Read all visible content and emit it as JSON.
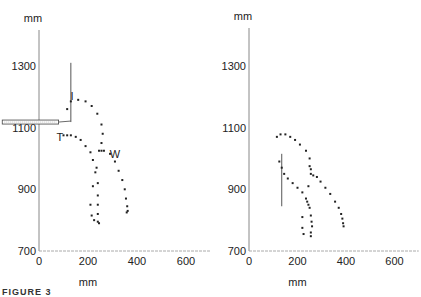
{
  "caption": "FIGURE 3",
  "chart_data": [
    {
      "type": "scatter",
      "panel": "left",
      "title": "",
      "xlabel": "mm",
      "ylabel": "mm",
      "xlim": [
        0,
        700
      ],
      "ylim": [
        700,
        1400
      ],
      "x_ticks": [
        0,
        200,
        400,
        600
      ],
      "y_ticks": [
        700,
        900,
        1100,
        1300
      ],
      "grid": false,
      "annotations": [
        {
          "text": "I",
          "x": 135,
          "y": 1190
        },
        {
          "text": "T",
          "x": 85,
          "y": 1055
        },
        {
          "text": "W",
          "x": 310,
          "y": 1000
        }
      ],
      "apparatus": {
        "horizontal_bar": {
          "x0": -150,
          "x1": 80,
          "y": 1118
        },
        "vertical_line": {
          "x": 130,
          "y0": 1118,
          "y1": 1310
        }
      },
      "series": [
        {
          "name": "I-W trajectory",
          "points": [
            [
              115,
              1160
            ],
            [
              130,
              1185
            ],
            [
              160,
              1190
            ],
            [
              190,
              1185
            ],
            [
              215,
              1170
            ],
            [
              238,
              1145
            ],
            [
              255,
              1110
            ],
            [
              260,
              1080
            ],
            [
              255,
              1050
            ],
            [
              245,
              1025
            ],
            [
              255,
              1025
            ],
            [
              265,
              1025
            ],
            [
              290,
              1015
            ],
            [
              310,
              990
            ],
            [
              325,
              960
            ],
            [
              340,
              930
            ],
            [
              350,
              900
            ],
            [
              355,
              870
            ],
            [
              360,
              845
            ],
            [
              362,
              830
            ],
            [
              358,
              825
            ]
          ]
        },
        {
          "name": "T trajectory",
          "points": [
            [
              100,
              1075
            ],
            [
              115,
              1075
            ],
            [
              130,
              1075
            ],
            [
              150,
              1070
            ],
            [
              170,
              1060
            ],
            [
              190,
              1040
            ],
            [
              210,
              1020
            ],
            [
              220,
              995
            ],
            [
              235,
              970
            ],
            [
              230,
              955
            ],
            [
              220,
              910
            ],
            [
              240,
              920
            ],
            [
              240,
              880
            ],
            [
              210,
              850
            ],
            [
              240,
              850
            ],
            [
              215,
              815
            ],
            [
              240,
              820
            ],
            [
              225,
              800
            ],
            [
              240,
              795
            ],
            [
              245,
              790
            ]
          ]
        }
      ]
    },
    {
      "type": "scatter",
      "panel": "right",
      "title": "",
      "xlabel": "mm",
      "ylabel": "mm",
      "xlim": [
        0,
        700
      ],
      "ylim": [
        700,
        1400
      ],
      "x_ticks": [
        0,
        200,
        400,
        600
      ],
      "y_ticks": [
        700,
        900,
        1100,
        1300
      ],
      "grid": false,
      "annotations": [],
      "apparatus": {
        "vertical_line": {
          "x": 135,
          "y0": 845,
          "y1": 1015
        }
      },
      "series": [
        {
          "name": "upper trajectory",
          "points": [
            [
              115,
              1070
            ],
            [
              130,
              1078
            ],
            [
              150,
              1078
            ],
            [
              170,
              1070
            ],
            [
              190,
              1060
            ],
            [
              210,
              1045
            ],
            [
              235,
              1025
            ],
            [
              250,
              1000
            ],
            [
              250,
              975
            ],
            [
              255,
              965
            ],
            [
              255,
              950
            ],
            [
              265,
              945
            ],
            [
              280,
              940
            ],
            [
              295,
              925
            ],
            [
              315,
              905
            ],
            [
              335,
              885
            ],
            [
              355,
              860
            ],
            [
              370,
              840
            ],
            [
              380,
              820
            ],
            [
              385,
              805
            ],
            [
              388,
              790
            ],
            [
              390,
              780
            ]
          ]
        },
        {
          "name": "lower trajectory",
          "points": [
            [
              125,
              990
            ],
            [
              135,
              970
            ],
            [
              145,
              950
            ],
            [
              160,
              935
            ],
            [
              180,
              920
            ],
            [
              200,
              905
            ],
            [
              220,
              890
            ],
            [
              235,
              870
            ],
            [
              240,
              860
            ],
            [
              245,
              850
            ],
            [
              250,
              840
            ],
            [
              255,
              815
            ],
            [
              258,
              795
            ],
            [
              260,
              780
            ],
            [
              255,
              760
            ],
            [
              255,
              748
            ],
            [
              220,
              810
            ],
            [
              220,
              775
            ],
            [
              225,
              755
            ],
            [
              245,
              910
            ]
          ]
        }
      ]
    }
  ]
}
